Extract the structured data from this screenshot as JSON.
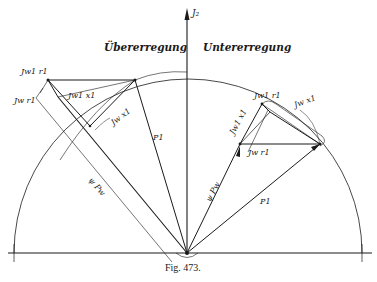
{
  "figure": {
    "caption": "Fig. 473.",
    "axis_label": "J₂",
    "region_left": "Übererregung",
    "region_right": "Untererregung"
  },
  "left_diagram": {
    "labels": {
      "jw1_r1": "Jw1 r1",
      "jw_r1": "Jw r1",
      "jw1_x1": "Jw1 x1",
      "jw_x1": "Jw x1",
      "p1": "P1",
      "psi_pw": "ψ Pw"
    }
  },
  "right_diagram": {
    "labels": {
      "jw1_r1": "Jw1 r1",
      "jw_x1": "Jw x1",
      "jw1_x1": "Jw1 x1",
      "jw_r1": "Jw r1",
      "p1": "P1",
      "psi_pw": "ψ Pw"
    }
  }
}
